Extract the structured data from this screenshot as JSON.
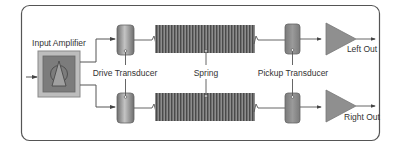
{
  "diagram": {
    "type": "spring-reverb-block-diagram",
    "labels": {
      "input_amplifier": "Input Amplifier",
      "drive_transducer": "Drive Transducer",
      "spring": "Spring",
      "pickup_transducer": "Pickup Transducer",
      "left_out": "Left Out",
      "right_out": "Right Out"
    },
    "channels": [
      {
        "name": "left",
        "output_label": "Left Out"
      },
      {
        "name": "right",
        "output_label": "Right Out"
      }
    ],
    "colors": {
      "border": "#555555",
      "amp_outer": "#b8b8b8",
      "amp_inner": "#7a7a7a",
      "transducer": "#8c8c8c",
      "spring": "#6a6a6a",
      "output_amp": "#8f8f8f",
      "line": "#555555"
    }
  }
}
